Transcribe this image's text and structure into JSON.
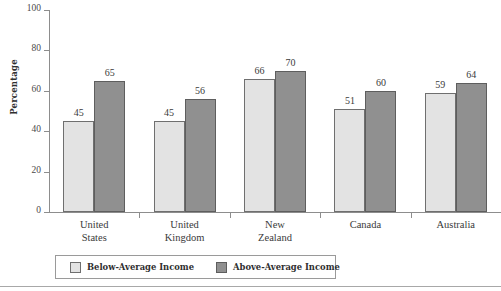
{
  "chart_data": {
    "type": "bar",
    "title": "",
    "xlabel": "",
    "ylabel": "Percentage",
    "ylim": [
      0,
      100
    ],
    "yticks": [
      0,
      20,
      40,
      60,
      80,
      100
    ],
    "grid": false,
    "legend_position": "bottom",
    "categories": [
      "United States",
      "United Kingdom",
      "New Zealand",
      "Canada",
      "Australia"
    ],
    "category_lines": [
      [
        "United",
        "States"
      ],
      [
        "United",
        "Kingdom"
      ],
      [
        "New",
        "Zealand"
      ],
      [
        "Canada",
        ""
      ],
      [
        "Australia",
        ""
      ]
    ],
    "series": [
      {
        "name": "Below-Average Income",
        "color": "#e3e3e3",
        "values": [
          45,
          45,
          66,
          51,
          59
        ]
      },
      {
        "name": "Above-Average Income",
        "color": "#909090",
        "values": [
          65,
          56,
          70,
          60,
          64
        ]
      }
    ]
  },
  "legend": {
    "items": [
      {
        "label": "Below-Average Income",
        "color": "#e3e3e3"
      },
      {
        "label": "Above-Average Income",
        "color": "#909090"
      }
    ]
  },
  "axis": {
    "y_title": "Percentage",
    "y_tick_labels": [
      "100",
      "80",
      "60",
      "40",
      "20",
      "0"
    ]
  }
}
